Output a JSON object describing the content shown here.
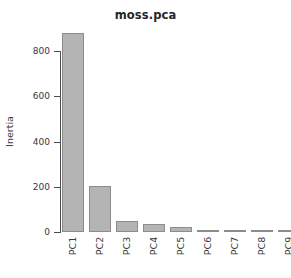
{
  "chart_data": {
    "type": "bar",
    "title": "moss.pca",
    "subtitle": "",
    "xlabel": "",
    "ylabel": "Inertia",
    "categories": [
      "PC1",
      "PC2",
      "PC3",
      "PC4",
      "PC5",
      "PC6",
      "PC7",
      "PC8",
      "PC9"
    ],
    "values": [
      880,
      204,
      49,
      35,
      22,
      6,
      5,
      4,
      2
    ],
    "ylim": [
      0,
      880
    ],
    "yticks": [
      0,
      200,
      400,
      600,
      800
    ],
    "ytick_labels": [
      "0",
      "200",
      "400",
      "600",
      "800"
    ],
    "grid": false,
    "legend": null,
    "bar_color": "#b4b4b4",
    "bar_border_color": "#8c8c8c",
    "axis_color": "#4d4d4d",
    "text_color": "#3a3a3a",
    "background": "#ffffff"
  },
  "plot": {
    "title": "moss.pca",
    "y_axis_title": "Inertia"
  }
}
